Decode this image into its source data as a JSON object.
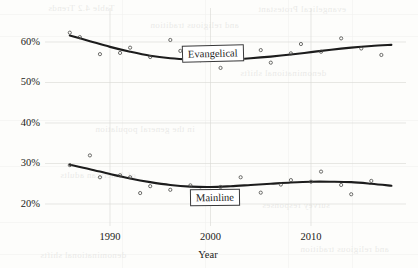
{
  "chart_data": {
    "type": "line",
    "title": "",
    "subtitle": "",
    "xlabel": "Year",
    "ylabel": "",
    "xlim": [
      1985,
      2018
    ],
    "ylim": [
      18,
      64
    ],
    "grid": true,
    "legend_position": "inline-labels",
    "x_ticks": [
      {
        "value": 1990,
        "label": "1990"
      },
      {
        "value": 2000,
        "label": "2000"
      },
      {
        "value": 2010,
        "label": "2010"
      }
    ],
    "y_ticks": [
      {
        "value": 60,
        "label": "60%"
      },
      {
        "value": 50,
        "label": "50%"
      },
      {
        "value": 40,
        "label": "40%"
      },
      {
        "value": 30,
        "label": "30%"
      },
      {
        "value": 20,
        "label": "20%"
      }
    ],
    "annotations": [
      {
        "name": "evangelical-label",
        "text": "Evangelical",
        "x": 2000,
        "y": 56.5
      },
      {
        "name": "mainline-label",
        "text": "Mainline",
        "x": 2001,
        "y": 24.5
      }
    ],
    "series": [
      {
        "name": "Evangelical",
        "fit": [
          [
            1986,
            61.6
          ],
          [
            1988,
            60.2
          ],
          [
            1990,
            58.8
          ],
          [
            1992,
            57.6
          ],
          [
            1994,
            56.6
          ],
          [
            1996,
            56.0
          ],
          [
            1998,
            55.7
          ],
          [
            2000,
            55.6
          ],
          [
            2002,
            55.7
          ],
          [
            2004,
            56.0
          ],
          [
            2006,
            56.4
          ],
          [
            2008,
            56.9
          ],
          [
            2010,
            57.5
          ],
          [
            2012,
            58.1
          ],
          [
            2014,
            58.6
          ],
          [
            2016,
            59.0
          ],
          [
            2018,
            59.3
          ]
        ],
        "points": [
          [
            1986,
            62.3
          ],
          [
            1987,
            61.2
          ],
          [
            1989,
            57.0
          ],
          [
            1991,
            57.3
          ],
          [
            1992,
            58.6
          ],
          [
            1994,
            56.3
          ],
          [
            1996,
            60.5
          ],
          [
            1997,
            57.8
          ],
          [
            1999,
            55.5
          ],
          [
            2000,
            55.9
          ],
          [
            2001,
            53.6
          ],
          [
            2003,
            56.4
          ],
          [
            2005,
            58.0
          ],
          [
            2006,
            54.9
          ],
          [
            2008,
            57.2
          ],
          [
            2009,
            59.5
          ],
          [
            2011,
            57.6
          ],
          [
            2013,
            60.9
          ],
          [
            2015,
            58.4
          ],
          [
            2017,
            56.8
          ]
        ]
      },
      {
        "name": "Mainline",
        "fit": [
          [
            1986,
            29.7
          ],
          [
            1988,
            28.6
          ],
          [
            1990,
            27.4
          ],
          [
            1992,
            26.3
          ],
          [
            1994,
            25.4
          ],
          [
            1996,
            24.7
          ],
          [
            1998,
            24.3
          ],
          [
            2000,
            24.2
          ],
          [
            2002,
            24.4
          ],
          [
            2004,
            24.7
          ],
          [
            2006,
            25.0
          ],
          [
            2008,
            25.3
          ],
          [
            2010,
            25.5
          ],
          [
            2012,
            25.5
          ],
          [
            2014,
            25.4
          ],
          [
            2016,
            25.0
          ],
          [
            2018,
            24.5
          ]
        ],
        "points": [
          [
            1986,
            29.6
          ],
          [
            1988,
            32.0
          ],
          [
            1989,
            26.6
          ],
          [
            1991,
            27.1
          ],
          [
            1992,
            26.6
          ],
          [
            1993,
            22.7
          ],
          [
            1994,
            24.4
          ],
          [
            1996,
            23.5
          ],
          [
            1998,
            24.6
          ],
          [
            1999,
            23.3
          ],
          [
            2001,
            24.2
          ],
          [
            2003,
            26.6
          ],
          [
            2005,
            22.8
          ],
          [
            2007,
            24.8
          ],
          [
            2008,
            25.9
          ],
          [
            2010,
            25.5
          ],
          [
            2011,
            28.0
          ],
          [
            2013,
            24.7
          ],
          [
            2014,
            22.4
          ],
          [
            2016,
            25.7
          ]
        ]
      }
    ]
  },
  "ghost_text": {
    "lines": [
      "and religious tradition",
      "in the general population",
      "denominational shifts",
      "of American adults",
      "survey responses",
      "Table 4.2 Trends",
      "evangelical Protestant"
    ]
  }
}
